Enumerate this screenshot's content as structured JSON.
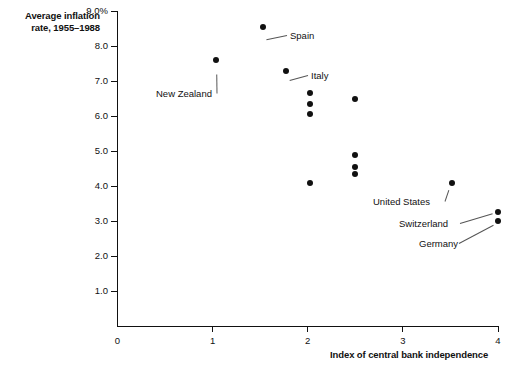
{
  "chart_data": {
    "type": "scatter",
    "title": "",
    "ylabel": "Average inflation rate, 1955–1988",
    "ylabel_lines": [
      "Average inflation",
      "rate, 1955–1988"
    ],
    "xlabel": "Index of central bank independence",
    "xlim": [
      0,
      4
    ],
    "ylim": [
      0,
      9
    ],
    "grid": false,
    "legend": false,
    "xticks": [
      "0",
      "1",
      "2",
      "3",
      "4"
    ],
    "xtick_values": [
      0,
      1,
      2,
      3,
      4
    ],
    "yticks": [
      "1.0",
      "2.0",
      "3.0",
      "4.0",
      "5.0",
      "6.0",
      "7.0",
      "8.0",
      "9.0%"
    ],
    "ytick_values": [
      1,
      2,
      3,
      4,
      5,
      6,
      7,
      8,
      9
    ],
    "marker_color": "#111111",
    "axis_color": "#111111",
    "points": [
      {
        "x": 1.04,
        "y": 7.6,
        "label": "New Zealand"
      },
      {
        "x": 1.53,
        "y": 8.55,
        "label": "Spain"
      },
      {
        "x": 1.77,
        "y": 7.3,
        "label": "Italy"
      },
      {
        "x": 2.02,
        "y": 6.65,
        "label": ""
      },
      {
        "x": 2.02,
        "y": 6.35,
        "label": ""
      },
      {
        "x": 2.02,
        "y": 6.05,
        "label": ""
      },
      {
        "x": 2.5,
        "y": 6.5,
        "label": ""
      },
      {
        "x": 2.02,
        "y": 4.1,
        "label": ""
      },
      {
        "x": 2.5,
        "y": 4.9,
        "label": ""
      },
      {
        "x": 2.5,
        "y": 4.55,
        "label": ""
      },
      {
        "x": 2.5,
        "y": 4.35,
        "label": ""
      },
      {
        "x": 3.52,
        "y": 4.1,
        "label": "United States"
      },
      {
        "x": 4.0,
        "y": 3.25,
        "label": "Switzerland"
      },
      {
        "x": 4.0,
        "y": 3.0,
        "label": "Germany"
      }
    ],
    "annotations": [
      {
        "text": "Spain",
        "text_x": 290,
        "text_y": 31,
        "dot_x": 263,
        "dot_y": 40,
        "leader": true
      },
      {
        "text": "New Zealand",
        "text_x": 156,
        "text_y": 89,
        "dot_x": 217,
        "dot_y": 70,
        "leader": true
      },
      {
        "text": "Italy",
        "text_x": 311,
        "text_y": 71,
        "dot_x": 286,
        "dot_y": 81,
        "leader": true
      },
      {
        "text": "United States",
        "text_x": 373,
        "text_y": 197,
        "dot_x": 450,
        "dot_y": 186,
        "leader": true
      },
      {
        "text": "Switzerland",
        "text_x": 399,
        "text_y": 219,
        "dot_x": 497,
        "dot_y": 212,
        "leader": true
      },
      {
        "text": "Germany",
        "text_x": 419,
        "text_y": 239,
        "dot_x": 497,
        "dot_y": 223,
        "leader": true
      }
    ]
  }
}
